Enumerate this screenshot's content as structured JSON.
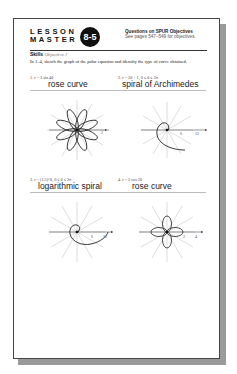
{
  "header": {
    "title_line1": "LESSON",
    "title_line2": "MASTER",
    "lesson_number": "8-5",
    "spur_title": "Questions on SPUR Objectives",
    "spur_subtitle": "See pages 547–549 for objectives."
  },
  "section": {
    "label": "Skills",
    "objective": "Objective J"
  },
  "instructions": "In 1–4, sketch the graph of the polar equation and identify the type of curve obtained.",
  "questions": [
    {
      "number": "1.",
      "equation": "r = 3 sin 4θ",
      "answer": "rose curve",
      "graph": "8-petal rose",
      "axis_labels": [
        "3"
      ]
    },
    {
      "number": "2.",
      "equation": "r = 2θ + 1, 0 ≤ θ ≤ 2π",
      "answer": "spiral of Archimedes",
      "graph": "archimedean spiral",
      "axis_labels": [
        "6",
        "12"
      ]
    },
    {
      "number": "3.",
      "equation": "r = (1.5)^θ, 0 ≤ θ ≤ 2π",
      "answer": "logarithmic spiral",
      "graph": "logarithmic spiral",
      "axis_labels": [
        "6",
        "12"
      ]
    },
    {
      "number": "4.",
      "equation": "r = 2 cos 2θ",
      "answer": "rose curve",
      "graph": "4-petal rose",
      "axis_labels": [
        "2",
        "4"
      ]
    }
  ]
}
